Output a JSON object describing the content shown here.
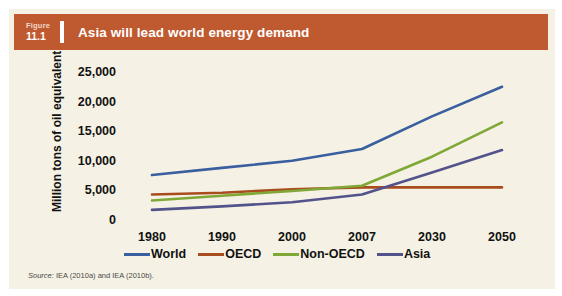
{
  "figure": {
    "number_word": "Figure",
    "number": "11.1",
    "title": "Asia will lead world energy demand",
    "banner_color": "#bf5a30",
    "background_color": "#f5f1e4"
  },
  "source": {
    "lead": "Source:",
    "text": " IEA (2010a) and IEA (2010b)."
  },
  "chart_data": {
    "type": "line",
    "title": "Asia will lead world energy demand",
    "xlabel": "",
    "ylabel": "Million tons of oil equivalent",
    "x": [
      "1980",
      "1990",
      "2000",
      "2007",
      "2030",
      "2050"
    ],
    "categories": [
      "1980",
      "1990",
      "2000",
      "2007",
      "2030",
      "2050"
    ],
    "ylim": [
      0,
      25000
    ],
    "yticks": [
      0,
      5000,
      10000,
      15000,
      20000,
      25000
    ],
    "ytick_labels": [
      "0",
      "5,000",
      "10,000",
      "15,000",
      "20,000",
      "25,000"
    ],
    "grid": false,
    "legend_position": "bottom",
    "series": [
      {
        "name": "World",
        "color": "#3a5f9e",
        "values": [
          7600,
          8800,
          10000,
          12000,
          17500,
          22500
        ]
      },
      {
        "name": "OECD",
        "color": "#a94c1e",
        "values": [
          4300,
          4600,
          5200,
          5500,
          5500,
          5500
        ]
      },
      {
        "name": "Non-OECD",
        "color": "#7fa836",
        "values": [
          3300,
          4100,
          4900,
          5800,
          10700,
          16500
        ]
      },
      {
        "name": "Asia",
        "color": "#53538c",
        "values": [
          1700,
          2300,
          3000,
          4300,
          8000,
          11800
        ]
      }
    ]
  }
}
